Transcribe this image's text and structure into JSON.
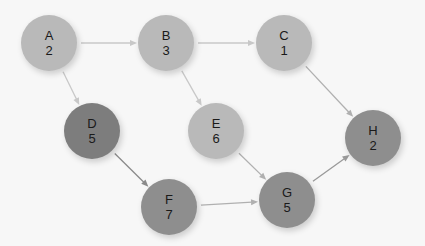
{
  "diagram": {
    "type": "activity-network",
    "nodes": [
      {
        "id": "A",
        "label": "A",
        "value": "2",
        "x": 49,
        "y": 43,
        "color": "#b9b9b9"
      },
      {
        "id": "B",
        "label": "B",
        "value": "3",
        "x": 166,
        "y": 43,
        "color": "#b9b9b9"
      },
      {
        "id": "C",
        "label": "C",
        "value": "1",
        "x": 284,
        "y": 43,
        "color": "#b9b9b9"
      },
      {
        "id": "D",
        "label": "D",
        "value": "5",
        "x": 92,
        "y": 131,
        "color": "#7d7d7d"
      },
      {
        "id": "E",
        "label": "E",
        "value": "6",
        "x": 216,
        "y": 131,
        "color": "#b9b9b9"
      },
      {
        "id": "F",
        "label": "F",
        "value": "7",
        "x": 169,
        "y": 207,
        "color": "#8e8e8e"
      },
      {
        "id": "G",
        "label": "G",
        "value": "5",
        "x": 287,
        "y": 200,
        "color": "#8e8e8e"
      },
      {
        "id": "H",
        "label": "H",
        "value": "2",
        "x": 373,
        "y": 138,
        "color": "#8e8e8e"
      }
    ],
    "edges": [
      {
        "from": "A",
        "to": "B",
        "color": "#c8c8c8"
      },
      {
        "from": "A",
        "to": "D",
        "color": "#c8c8c8"
      },
      {
        "from": "B",
        "to": "C",
        "color": "#c8c8c8"
      },
      {
        "from": "B",
        "to": "E",
        "color": "#c8c8c8"
      },
      {
        "from": "C",
        "to": "H",
        "color": "#b0b0b0"
      },
      {
        "from": "D",
        "to": "F",
        "color": "#8a8a8a"
      },
      {
        "from": "E",
        "to": "G",
        "color": "#b0b0b0"
      },
      {
        "from": "F",
        "to": "G",
        "color": "#b0b0b0"
      },
      {
        "from": "G",
        "to": "H",
        "color": "#9a9a9a"
      }
    ]
  }
}
